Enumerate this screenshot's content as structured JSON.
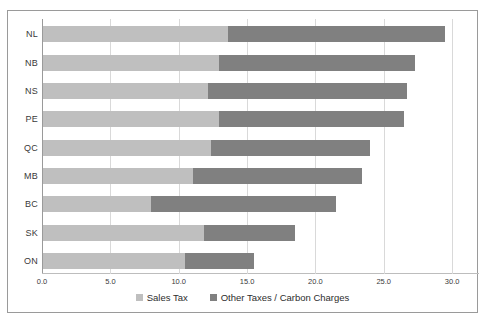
{
  "chart_data": {
    "type": "bar",
    "orientation": "horizontal",
    "stacked": true,
    "title": "",
    "subtitle": "",
    "xlabel": "",
    "ylabel": "",
    "xlim": [
      0.0,
      30.0
    ],
    "xticks": [
      "0.0",
      "5.0",
      "10.0",
      "15.0",
      "20.0",
      "25.0",
      "30.0"
    ],
    "xtick_values": [
      0.0,
      5.0,
      10.0,
      15.0,
      20.0,
      25.0,
      30.0
    ],
    "grid": true,
    "legend_position": "bottom",
    "categories": [
      "NL",
      "NB",
      "NS",
      "PE",
      "QC",
      "MB",
      "BC",
      "SK",
      "ON"
    ],
    "series": [
      {
        "name": "Sales Tax",
        "color": "#bfbfbf",
        "values": [
          13.5,
          12.9,
          12.1,
          12.9,
          12.3,
          11.0,
          7.9,
          11.8,
          10.4
        ]
      },
      {
        "name": "Other Taxes / Carbon Charges",
        "color": "#808080",
        "values": [
          15.9,
          14.3,
          14.5,
          13.5,
          11.6,
          12.3,
          13.5,
          6.6,
          5.0
        ]
      }
    ],
    "totals": [
      29.4,
      27.2,
      26.6,
      26.4,
      23.9,
      23.3,
      21.4,
      18.4,
      15.4
    ]
  },
  "legend": {
    "items": [
      {
        "label": "Sales Tax",
        "swatch": "sales"
      },
      {
        "label": "Other Taxes / Carbon Charges",
        "swatch": "other"
      }
    ]
  },
  "colors": {
    "sales_tax": "#bfbfbf",
    "other_taxes": "#808080",
    "gridline": "#d9d9d9",
    "frame_border": "#9a9a9a",
    "text": "#3a3a3a",
    "background": "#ffffff"
  }
}
